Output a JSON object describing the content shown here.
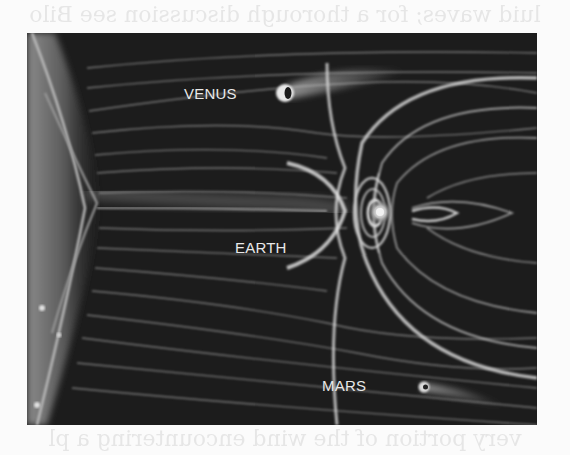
{
  "page": {
    "ghost_top_text": "luid waves; for a thorough discussion see Bilo",
    "ghost_bottom_text": "very portion of the wind encountering a pl"
  },
  "figure": {
    "background_color": "#1c1c1c",
    "field_line_color": "#cfcfcf",
    "labels": {
      "venus": "VENUS",
      "earth": "EARTH",
      "mars": "MARS"
    },
    "icons": {
      "sun": "sun-limb-icon",
      "venus": "venus-planet-icon",
      "earth": "earth-planet-icon",
      "mars": "mars-planet-icon"
    }
  }
}
